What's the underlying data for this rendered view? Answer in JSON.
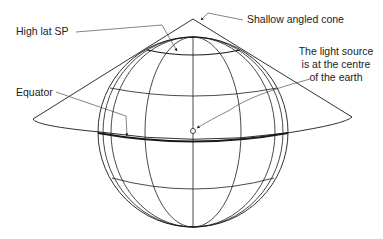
{
  "diagram": {
    "type": "conic-projection-illustration",
    "labels": {
      "high_lat_sp": "High lat SP",
      "equator": "Equator",
      "cone": "Shallow angled cone",
      "light_source_line1": "The light source",
      "light_source_line2": "is at the centre",
      "light_source_line3": "of the earth"
    },
    "colors": {
      "line": "#1a1a1a",
      "text": "#222222",
      "background": "#ffffff"
    }
  }
}
